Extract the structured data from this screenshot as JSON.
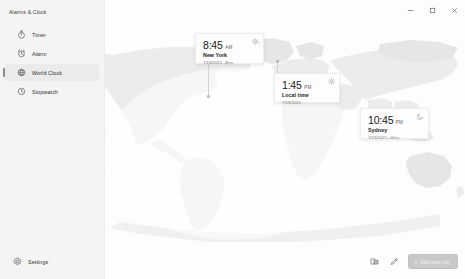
{
  "window": {
    "app_title": "Alarms & Clock",
    "controls": [
      {
        "name": "minimize",
        "label": "—"
      },
      {
        "name": "maximize",
        "label": "□"
      },
      {
        "name": "close",
        "label": "✕"
      }
    ]
  },
  "sidebar": {
    "items": [
      {
        "label": "Timer",
        "icon": "timer-icon",
        "selected": false
      },
      {
        "label": "Alarm",
        "icon": "alarm-icon",
        "selected": false
      },
      {
        "label": "World Clock",
        "icon": "world-clock-icon",
        "selected": true
      },
      {
        "label": "Stopwatch",
        "icon": "stopwatch-icon",
        "selected": false
      }
    ],
    "settings": {
      "label": "Settings",
      "icon": "gear-icon"
    }
  },
  "map": {
    "view": "world-clock-map",
    "cities": [
      {
        "id": "new-york",
        "time": "8:45",
        "ampm": "AM",
        "city": "New York",
        "subtitle": "7/19/2021  -4hrs",
        "daynight": "sun-icon"
      },
      {
        "id": "local-time",
        "time": "1:45",
        "ampm": "PM",
        "city": "Local time",
        "subtitle": "7/19/2021",
        "daynight": "sun-icon"
      },
      {
        "id": "sydney",
        "time": "10:45",
        "ampm": "PM",
        "city": "Sydney",
        "subtitle": "7/19/2021  +6hrs",
        "daynight": "moon-icon"
      }
    ]
  },
  "command_bar": {
    "compare_label": "compare-icon",
    "edit_label": "edit-icon",
    "add_city": {
      "plus": "+",
      "label": "Add new city"
    }
  },
  "colors": {
    "nav_background": "#f4f4f4",
    "content_background": "#fdfdfd",
    "land": "#ececec",
    "card_background": "#fdfdfd",
    "accent_button": "#c9c9c9",
    "selected_highlight": "#ebebeb"
  }
}
